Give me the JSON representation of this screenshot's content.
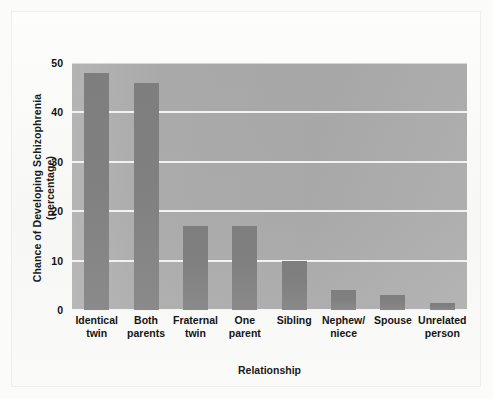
{
  "chart_data": {
    "type": "bar",
    "title": "",
    "subtitle": "",
    "xlabel": "Relationship",
    "ylabel": "Chance of Developing Schizophrenia (percentage)",
    "categories": [
      "Identical\ntwin",
      "Both\nparents",
      "Fraternal\ntwin",
      "One\nparent",
      "Sibling",
      "Nephew/\nniece",
      "Spouse",
      "Unrelated\nperson"
    ],
    "values": [
      48,
      46,
      17,
      17,
      10,
      4,
      3,
      1.5
    ],
    "ylim": [
      0,
      50
    ],
    "yticks": [
      0,
      10,
      20,
      30,
      40,
      50
    ],
    "ytick_labels": [
      "0",
      "10",
      "20",
      "30",
      "40",
      "50"
    ],
    "grid": true,
    "grid_axis": "y",
    "grid_color": "#f2f2f2",
    "legend": false,
    "legend_position": "none",
    "bar_color": "#808080",
    "plot_background": "#a9a9a9",
    "figure_background": "#fbfbfa"
  }
}
